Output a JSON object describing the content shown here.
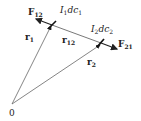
{
  "diagram": {
    "origin_label": "0",
    "vectors": [
      {
        "name": "r1",
        "label": "r",
        "sub": "1"
      },
      {
        "name": "r2",
        "label": "r",
        "sub": "2"
      },
      {
        "name": "r12",
        "label": "r",
        "sub": "12"
      }
    ],
    "forces": [
      {
        "name": "F12",
        "label": "F",
        "sub": "12"
      },
      {
        "name": "F21",
        "label": "F",
        "sub": "21"
      }
    ],
    "current_elements": [
      {
        "name": "I1dc1",
        "I": "I",
        "isub": "1",
        "d": "dc",
        "dsub": "1"
      },
      {
        "name": "I2dc2",
        "I": "I",
        "isub": "2",
        "d": "dc",
        "dsub": "2"
      }
    ],
    "colors": {
      "line": "#555555",
      "thick": "#222222",
      "text": "#222222"
    }
  }
}
